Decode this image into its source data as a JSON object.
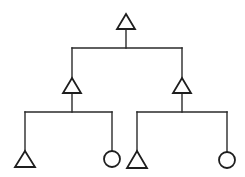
{
  "diagram": {
    "type": "pedigree-tree",
    "colors": {
      "line": "#2a2a2a",
      "shape_stroke": "#1e1e1e",
      "shape_fill": "#ffffff",
      "background": "#ffffff"
    },
    "nodes": [
      {
        "id": "root",
        "shape": "triangle",
        "cx": 126,
        "top": 14,
        "bottom": 29,
        "half_width": 9
      },
      {
        "id": "left-child",
        "shape": "triangle",
        "cx": 72,
        "top": 78,
        "bottom": 93,
        "half_width": 9
      },
      {
        "id": "right-child",
        "shape": "triangle",
        "cx": 182,
        "top": 78,
        "bottom": 93,
        "half_width": 9
      },
      {
        "id": "left-left-leaf",
        "shape": "triangle",
        "cx": 25,
        "top": 151,
        "bottom": 167,
        "half_width": 10
      },
      {
        "id": "left-right-leaf",
        "shape": "circle",
        "cx": 112,
        "cy": 159,
        "r": 8
      },
      {
        "id": "right-left-leaf",
        "shape": "triangle",
        "cx": 137,
        "top": 151,
        "bottom": 168,
        "half_width": 10
      },
      {
        "id": "right-right-leaf",
        "shape": "circle",
        "cx": 227,
        "cy": 160,
        "r": 8
      }
    ],
    "edges": [
      {
        "id": "root-stem",
        "points": [
          [
            126,
            29
          ],
          [
            126,
            48
          ]
        ]
      },
      {
        "id": "root-bar",
        "points": [
          [
            72,
            48
          ],
          [
            182,
            48
          ]
        ]
      },
      {
        "id": "root-to-left",
        "points": [
          [
            72,
            48
          ],
          [
            72,
            78
          ]
        ]
      },
      {
        "id": "root-to-right",
        "points": [
          [
            182,
            48
          ],
          [
            182,
            78
          ]
        ]
      },
      {
        "id": "left-stem",
        "points": [
          [
            72,
            93
          ],
          [
            72,
            112
          ]
        ]
      },
      {
        "id": "left-bar",
        "points": [
          [
            25,
            112
          ],
          [
            112,
            112
          ]
        ]
      },
      {
        "id": "left-to-leaf-a",
        "points": [
          [
            25,
            112
          ],
          [
            25,
            151
          ]
        ]
      },
      {
        "id": "left-to-leaf-b",
        "points": [
          [
            112,
            112
          ],
          [
            112,
            151
          ]
        ]
      },
      {
        "id": "right-stem",
        "points": [
          [
            182,
            93
          ],
          [
            182,
            112
          ]
        ]
      },
      {
        "id": "right-bar",
        "points": [
          [
            137,
            112
          ],
          [
            227,
            112
          ]
        ]
      },
      {
        "id": "right-to-leaf-a",
        "points": [
          [
            137,
            112
          ],
          [
            137,
            151
          ]
        ]
      },
      {
        "id": "right-to-leaf-b",
        "points": [
          [
            227,
            112
          ],
          [
            227,
            152
          ]
        ]
      }
    ]
  }
}
